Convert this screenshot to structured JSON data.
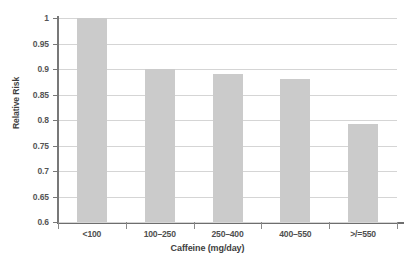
{
  "chart_data": {
    "type": "bar",
    "title": "",
    "subtitle": "",
    "xlabel": "Caffeine (mg/day)",
    "ylabel": "Relative Risk",
    "categories": [
      "<100",
      "100–250",
      "250–400",
      "400–550",
      ">/=550"
    ],
    "values": [
      1,
      0.9,
      0.89,
      0.88,
      0.793
    ],
    "series": [
      {
        "name": "Relative Risk",
        "values": [
          1,
          0.9,
          0.89,
          0.88,
          0.793
        ]
      }
    ],
    "ylim": [
      0.6,
      1
    ],
    "xlim": [
      0,
      5
    ],
    "yticks": [
      0.6,
      0.65,
      0.7,
      0.75,
      0.8,
      0.85,
      0.9,
      0.95,
      1
    ],
    "ytick_labels": [
      "0.6",
      "0.65",
      "0.7",
      "0.75",
      "0.8",
      "0.85",
      "0.9",
      "0.95",
      "1"
    ],
    "grid": true,
    "grid_axis": "y",
    "legend": false,
    "legend_position": "none",
    "bar_color": "#cbcbcb",
    "grid_color": "#d5d5d5",
    "axis_color": "#787878",
    "background_color": "#ffffff",
    "text_color": "#4a4a4a",
    "annotations": []
  }
}
